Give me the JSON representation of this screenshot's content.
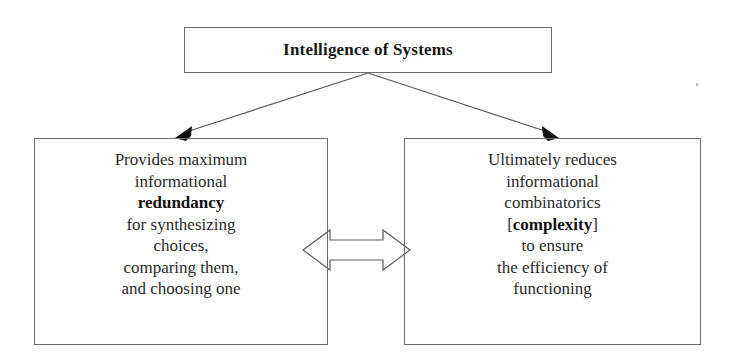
{
  "diagram": {
    "title": "Intelligence of Systems",
    "type": "hierarchy-diagram",
    "canvas": {
      "width": 737,
      "height": 364,
      "background": "#ffffff"
    },
    "style": {
      "line_color": "#5a5a5a",
      "text_color": "#2b2b2b",
      "arrow_fill": "#111111"
    },
    "nodes": {
      "root": {
        "id": "intelligence-of-systems",
        "label": "Intelligence of Systems",
        "bold": true
      },
      "left": {
        "id": "provides-maximum-redundancy",
        "lines": [
          {
            "text": "Provides maximum",
            "bold": false
          },
          {
            "text": "informational",
            "bold": false
          },
          {
            "text": "redundancy",
            "bold": true
          },
          {
            "text": "for synthesizing",
            "bold": false
          },
          {
            "text": "choices,",
            "bold": false
          },
          {
            "text": "comparing them,",
            "bold": false
          },
          {
            "text": "and choosing one",
            "bold": false
          }
        ]
      },
      "right": {
        "id": "ultimately-reduces-complexity",
        "lines": [
          {
            "text": "Ultimately reduces",
            "bold": false
          },
          {
            "text": "informational",
            "bold": false
          },
          {
            "text": "combinatorics",
            "bold": false
          },
          {
            "text": "[complexity]",
            "bold": true,
            "brackets": true
          },
          {
            "text": "to ensure",
            "bold": false
          },
          {
            "text": "the efficiency of",
            "bold": false
          },
          {
            "text": "functioning",
            "bold": false
          }
        ]
      }
    },
    "connectors": [
      {
        "id": "root-to-left",
        "from": "intelligence-of-systems",
        "to": "provides-maximum-redundancy",
        "kind": "line-arrow",
        "direction": "one-way"
      },
      {
        "id": "root-to-right",
        "from": "intelligence-of-systems",
        "to": "ultimately-reduces-complexity",
        "kind": "line-arrow",
        "direction": "one-way"
      },
      {
        "id": "left-right-link",
        "from": "provides-maximum-redundancy",
        "to": "ultimately-reduces-complexity",
        "kind": "block-arrow",
        "direction": "bidirectional"
      }
    ]
  }
}
